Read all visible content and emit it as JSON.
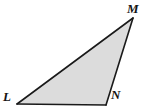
{
  "figure": {
    "name": "triangle-LMN",
    "type": "triangle",
    "canvas": {
      "width": 148,
      "height": 107
    },
    "colors": {
      "background": "#ffffff",
      "fill": "#dcdcdc",
      "stroke": "#1a1a1a",
      "label": "#141414"
    },
    "stroke_width": 1.6,
    "vertices": [
      {
        "id": "L",
        "label": "L",
        "x": 17,
        "y": 104,
        "label_x": 3,
        "label_y": 90
      },
      {
        "id": "M",
        "label": "M",
        "x": 133,
        "y": 18,
        "label_x": 127,
        "label_y": 2
      },
      {
        "id": "N",
        "label": "N",
        "x": 106,
        "y": 105,
        "label_x": 111,
        "label_y": 88
      }
    ],
    "edges": [
      {
        "id": "LM",
        "from": "L",
        "to": "M"
      },
      {
        "id": "MN",
        "from": "M",
        "to": "N"
      },
      {
        "id": "NL",
        "from": "N",
        "to": "L"
      }
    ],
    "polygon_points": "17,104 133,18 106,105"
  }
}
